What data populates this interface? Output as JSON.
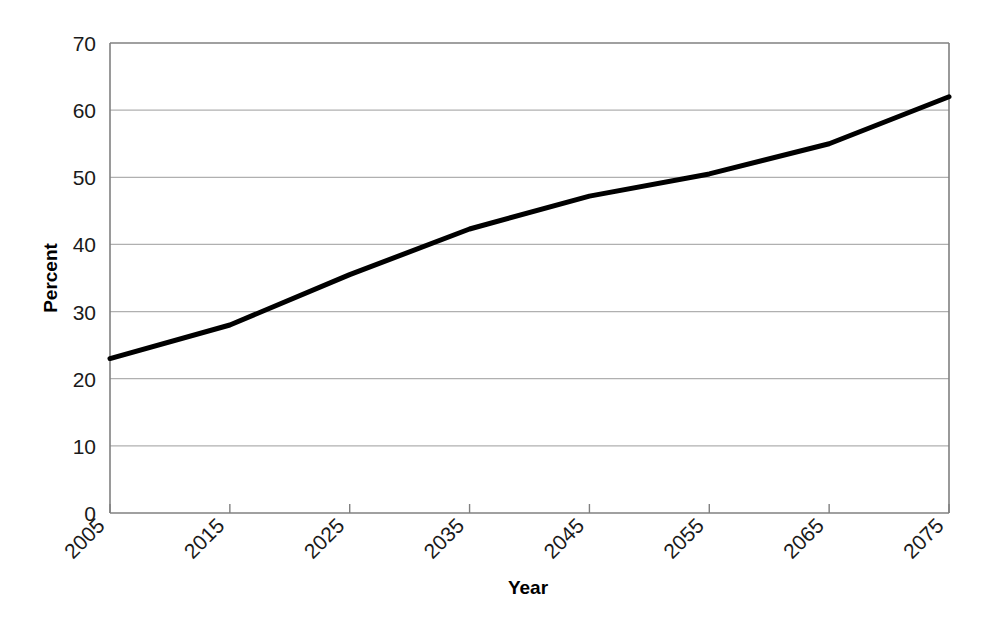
{
  "chart_data": {
    "type": "line",
    "title": "",
    "xlabel": "Year",
    "ylabel": "Percent",
    "x": [
      2005,
      2015,
      2025,
      2035,
      2045,
      2055,
      2065,
      2075
    ],
    "values": [
      23,
      28,
      35.5,
      42.3,
      47.2,
      50.5,
      55,
      62
    ],
    "series": [
      {
        "name": "Percent",
        "values": [
          23,
          28,
          35.5,
          42.3,
          47.2,
          50.5,
          55,
          62
        ]
      }
    ],
    "xlim": [
      2005,
      2075
    ],
    "ylim": [
      0,
      70
    ],
    "xtick_labels": [
      "2005",
      "2015",
      "2025",
      "2035",
      "2045",
      "2055",
      "2065",
      "2075"
    ],
    "ytick_labels": [
      "0",
      "10",
      "20",
      "30",
      "40",
      "50",
      "60",
      "70"
    ],
    "ytick_values": [
      0,
      10,
      20,
      30,
      40,
      50,
      60,
      70
    ],
    "grid": true,
    "grid_axis": "y",
    "legend": "none",
    "line_color": "#000000",
    "line_width": 5,
    "grid_color": "#b0b0b0",
    "axis_color": "#808080",
    "background": "#ffffff",
    "xtick_rotation": 45
  },
  "axis": {
    "y_title": "Percent",
    "x_title": "Year"
  }
}
